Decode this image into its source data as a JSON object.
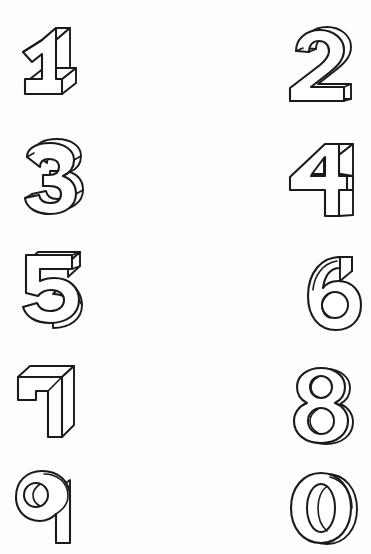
{
  "page": {
    "width": 371,
    "height": 554,
    "background_color": "#fdfdfd",
    "ink_color": "#1a1a1a",
    "style": "3d-extruded-outline",
    "columns": 2,
    "rows": 5
  },
  "glyphs": [
    {
      "id": "digit-1",
      "character": "1",
      "name": "one",
      "column": "left",
      "row": 1,
      "x": 18,
      "y": 27,
      "width": 62,
      "height": 75
    },
    {
      "id": "digit-2",
      "character": "2",
      "name": "two",
      "column": "right",
      "row": 1,
      "x": 288,
      "y": 29,
      "width": 66,
      "height": 72
    },
    {
      "id": "digit-3",
      "character": "3",
      "name": "three",
      "column": "left",
      "row": 2,
      "x": 18,
      "y": 139,
      "width": 62,
      "height": 74
    },
    {
      "id": "digit-4",
      "character": "4",
      "name": "four",
      "column": "right",
      "row": 2,
      "x": 287,
      "y": 143,
      "width": 68,
      "height": 73
    },
    {
      "id": "digit-5",
      "character": "5",
      "name": "five",
      "column": "left",
      "row": 3,
      "x": 18,
      "y": 251,
      "width": 63,
      "height": 73
    },
    {
      "id": "digit-6",
      "character": "6",
      "name": "six",
      "column": "right",
      "row": 3,
      "x": 291,
      "y": 255,
      "width": 62,
      "height": 74
    },
    {
      "id": "digit-7",
      "character": "7",
      "name": "seven",
      "column": "left",
      "row": 4,
      "x": 14,
      "y": 364,
      "width": 60,
      "height": 74
    },
    {
      "id": "digit-8",
      "character": "8",
      "name": "eight",
      "column": "right",
      "row": 4,
      "x": 291,
      "y": 368,
      "width": 60,
      "height": 74
    },
    {
      "id": "digit-9",
      "character": "9",
      "name": "nine",
      "column": "left",
      "row": 5,
      "x": 14,
      "y": 470,
      "width": 60,
      "height": 74
    },
    {
      "id": "digit-0",
      "character": "0",
      "name": "zero",
      "column": "right",
      "row": 5,
      "x": 291,
      "y": 472,
      "width": 60,
      "height": 74
    }
  ]
}
